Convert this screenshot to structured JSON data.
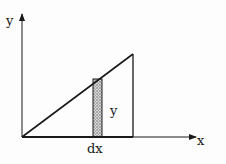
{
  "diagram": {
    "type": "integration-strip",
    "colors": {
      "stroke": "#1a1a1a",
      "strip_fill": "#bdbdbd",
      "background": "#fdfdfd"
    },
    "axes": {
      "x_label": "x",
      "y_label": "y"
    },
    "strip": {
      "height_label": "y",
      "width_label": "dx"
    }
  }
}
